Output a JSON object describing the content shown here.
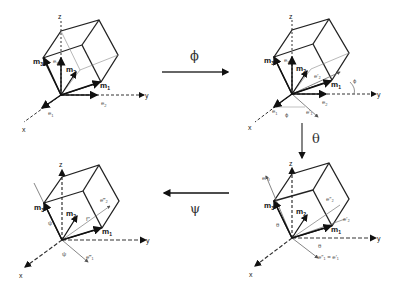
{
  "diagram": {
    "transitions": [
      {
        "id": "phi",
        "label": "ϕ",
        "from": "panel-1",
        "to": "panel-2",
        "direction": "right"
      },
      {
        "id": "theta",
        "label": "θ",
        "from": "panel-2",
        "to": "panel-3",
        "direction": "down"
      },
      {
        "id": "psi",
        "label": "ψ",
        "from": "panel-3",
        "to": "panel-4",
        "direction": "left"
      }
    ],
    "panels": [
      {
        "id": "panel-1",
        "position": "top-left",
        "axes": {
          "x": "x",
          "y": "y",
          "z": "z"
        },
        "vectors": {
          "m1": "m",
          "m1_sub": "1",
          "m2": "m",
          "m2_sub": "2",
          "m3": "m",
          "m3_sub": "3",
          "e1": "e",
          "e1_sub": "1",
          "e2": "e",
          "e2_sub": "2",
          "e3": "e",
          "e3_sub": "3"
        }
      },
      {
        "id": "panel-2",
        "position": "top-right",
        "axes": {
          "x": "x",
          "y": "y",
          "z": "z"
        },
        "angle_labels": [
          "ϕ",
          "ϕ"
        ],
        "primed": [
          "e′₁",
          "e′₂"
        ],
        "vectors": {
          "m1": "m",
          "m1_sub": "1",
          "m2": "m",
          "m2_sub": "2",
          "m3": "m",
          "m3_sub": "3",
          "e1": "e",
          "e1_sub": "1",
          "e2": "e",
          "e2_sub": "2",
          "e3": "e",
          "e3_sub": "3"
        }
      },
      {
        "id": "panel-3",
        "position": "bottom-right",
        "axes": {
          "x": "x",
          "y": "y",
          "z": "z"
        },
        "angle_labels": [
          "θ",
          "θ"
        ],
        "primed": [
          "e″₃",
          "e″₂",
          "e′₂",
          "e″₁ = e′₁"
        ],
        "vectors": {
          "m1": "m",
          "m1_sub": "1",
          "m2": "m",
          "m2_sub": "2",
          "m3": "m",
          "m3_sub": "3"
        }
      },
      {
        "id": "panel-4",
        "position": "bottom-left",
        "axes": {
          "x": "x",
          "y": "y",
          "z": "z"
        },
        "angle_labels": [
          "ψ",
          "ψ"
        ],
        "primed": [
          "e‴₂",
          "e‴₁",
          "f″"
        ],
        "vectors": {
          "m1": "m",
          "m1_sub": "1",
          "m2": "m",
          "m2_sub": "2",
          "m3": "m",
          "m3_sub": "3"
        }
      }
    ]
  }
}
